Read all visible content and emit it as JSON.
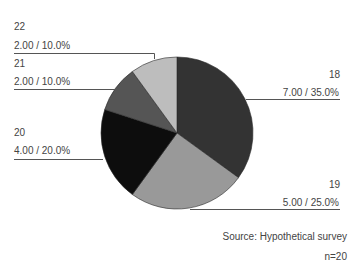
{
  "chart_data": {
    "type": "pie",
    "title": "",
    "categories": [
      "18",
      "19",
      "20",
      "21",
      "22"
    ],
    "values": [
      7.0,
      5.0,
      4.0,
      2.0,
      2.0
    ],
    "percentages": [
      35.0,
      25.0,
      20.0,
      10.0,
      10.0
    ],
    "slice_labels": [
      {
        "category": "18",
        "value_label": "7.00 / 35.0%"
      },
      {
        "category": "19",
        "value_label": "5.00 / 25.0%"
      },
      {
        "category": "20",
        "value_label": "4.00 / 20.0%"
      },
      {
        "category": "21",
        "value_label": "2.00 / 10.0%"
      },
      {
        "category": "22",
        "value_label": "2.00 / 10.0%"
      }
    ],
    "colors": [
      "#333333",
      "#999999",
      "#0d0d0d",
      "#555555",
      "#bdbdbd"
    ],
    "start_angle": "12 o'clock",
    "direction": "clockwise",
    "legend": "none",
    "annotations": [
      "Source: Hypothetical survey",
      "n=20"
    ]
  },
  "labels": {
    "s18": {
      "category": "18",
      "value": "7.00 / 35.0%"
    },
    "s19": {
      "category": "19",
      "value": "5.00 / 25.0%"
    },
    "s20": {
      "category": "20",
      "value": "4.00 / 20.0%"
    },
    "s21": {
      "category": "21",
      "value": "2.00 / 10.0%"
    },
    "s22": {
      "category": "22",
      "value": "2.00 / 10.0%"
    }
  },
  "footer": {
    "source": "Source: Hypothetical survey",
    "n": "n=20"
  }
}
